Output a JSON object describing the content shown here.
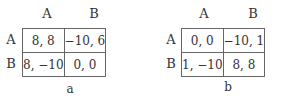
{
  "matrices": [
    {
      "caption": "a",
      "col_headers": [
        "A",
        "B"
      ],
      "row_headers": [
        "A",
        "B"
      ],
      "cells": [
        [
          "8, 8",
          "−10, 6"
        ],
        [
          "8, −10",
          "0, 0"
        ]
      ]
    },
    {
      "caption": "b",
      "col_headers": [
        "A",
        "B"
      ],
      "row_headers": [
        "A",
        "B"
      ],
      "cells": [
        [
          "0, 0",
          "−10, 1"
        ],
        [
          "1, −10",
          "8, 8"
        ]
      ]
    }
  ]
}
